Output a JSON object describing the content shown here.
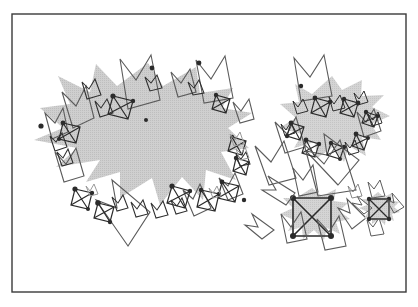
{
  "figure": {
    "domain_type": "diagram",
    "background_color": "#ffffff",
    "frame": {
      "label": "figure-border",
      "x": 12,
      "y": 14,
      "width": 394,
      "height": 278,
      "stroke_color": "#3a3a3a",
      "stroke_width": 1.4,
      "fill": "none"
    },
    "palette": {
      "blob_fill": "#c8c8c8",
      "blob_fill_alt": "#d2d2d2",
      "motif_dark": "#2b2b2b",
      "motif_mid": "#5a5a5a",
      "motif_light": "#9a9a9a",
      "paper_white": "#ffffff",
      "frame_stroke": "#3a3a3a"
    },
    "clusters": [
      {
        "name": "large-left-attractor",
        "center_x": 140,
        "center_y": 148,
        "radius_x": 108,
        "radius_y": 82,
        "spike_count": 11,
        "motif_count": 34,
        "description": "Large irregular star-shaped gray region with recursive crown and boxed-X motifs distributed along its boundary"
      },
      {
        "name": "small-right-attractor",
        "center_x": 330,
        "center_y": 115,
        "radius_x": 52,
        "radius_y": 40,
        "spike_count": 10,
        "motif_count": 22,
        "description": "Smaller self-similar copy of the left attractor positioned upper right"
      },
      {
        "name": "isolated-motif-bottom-right",
        "center_x": 312,
        "center_y": 215,
        "radius_x": 30,
        "radius_y": 26,
        "spike_count": 6,
        "motif_count": 7,
        "description": "Single boxed-X generator with surrounding crowns, at bottom right"
      },
      {
        "name": "tiny-motif-far-right",
        "center_x": 378,
        "center_y": 208,
        "radius_x": 14,
        "radius_y": 12,
        "spike_count": 5,
        "motif_count": 4,
        "description": "Smallest scale copy of the boxed-X generator"
      }
    ],
    "motif_legend": {
      "generator_name": "boxed-x-square",
      "generator_description": "Square outline with both diagonals drawn, vertices marked by filled dark nodes",
      "secondary_name": "crown-polygon",
      "secondary_description": "Four-point crown: square whose top edge folds inward into a deep V",
      "scales": [
        "large",
        "medium",
        "small",
        "tiny"
      ]
    }
  }
}
